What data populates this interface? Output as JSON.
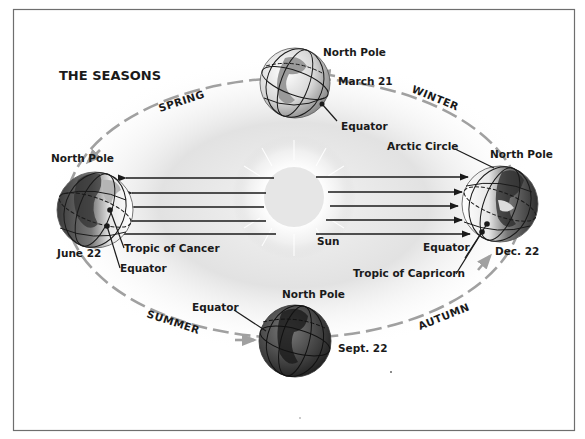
{
  "title": "THE SEASONS",
  "seasons": {
    "spring": "SPRING",
    "winter": "WINTER",
    "summer": "SUMMER",
    "autumn": "AUTUMN"
  },
  "sun": {
    "label": "Sun"
  },
  "earths": {
    "top": {
      "date": "March 21",
      "pole": "North Pole",
      "equator": "Equator"
    },
    "left": {
      "date": "June 22",
      "pole": "North Pole",
      "tropic": "Tropic of Cancer",
      "equator": "Equator"
    },
    "right": {
      "date": "Dec. 22",
      "pole": "North Pole",
      "arctic": "Arctic Circle",
      "equator": "Equator",
      "tropic": "Tropic of Capricorn"
    },
    "bottom": {
      "date": "Sept. 22",
      "pole": "North Pole",
      "equator": "Equator"
    }
  },
  "colors": {
    "frame": "#6e6e6e",
    "orbit": "#a0a0a0",
    "sun": "#e6e6e6",
    "glow": "#d8d8d8",
    "earth_dark": "#3a3a3a",
    "earth_light": "#eeeeee",
    "text": "#1a1a1a"
  }
}
